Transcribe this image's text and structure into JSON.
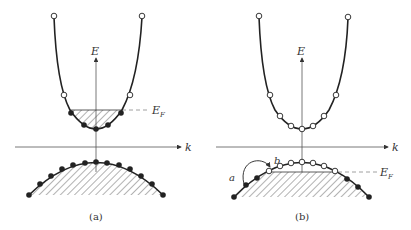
{
  "figure": {
    "panels": [
      {
        "id": "a",
        "caption": "(a)",
        "axis_e_label": "E",
        "axis_k_label": "k",
        "fermi_label": "E",
        "fermi_sub": "F",
        "description": "Conduction band partially filled with electrons below E_F; valence band fully filled"
      },
      {
        "id": "b",
        "caption": "(b)",
        "axis_e_label": "E",
        "axis_k_label": "k",
        "fermi_label": "E",
        "fermi_sub": "F",
        "point_a_label": "a",
        "point_b_label": "b",
        "description": "Valence band with holes above E_F near the top; electron transition from a to b"
      }
    ],
    "legend": {
      "filled_circle": "occupied state",
      "open_circle": "empty state"
    },
    "colors": {
      "line": "#222222",
      "axis": "#555555",
      "hatch": "#555555",
      "dashed": "#888888"
    }
  }
}
